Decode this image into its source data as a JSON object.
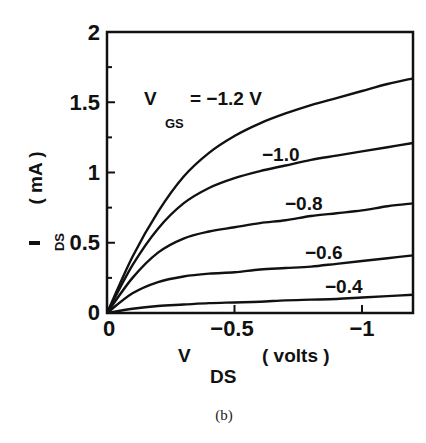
{
  "chart_data": {
    "type": "line",
    "title": "",
    "caption": "(b)",
    "xlabel": "V_DS ( volts )",
    "xlabel_main": "V",
    "xlabel_sub": "DS",
    "xlabel_unit": "( volts )",
    "ylabel": "I_DS ( mA )",
    "ylabel_main": "I",
    "ylabel_sub": "DS",
    "ylabel_unit": "( mA )",
    "xlim": [
      0,
      -1.2
    ],
    "ylim": [
      0,
      2
    ],
    "x_ticks": [
      0,
      -0.5,
      -1
    ],
    "x_tick_labels": [
      "0",
      "−0.5",
      "−1"
    ],
    "y_ticks": [
      0,
      0.5,
      1,
      1.5,
      2
    ],
    "y_tick_labels": [
      "0",
      "0.5",
      "1",
      "1.5",
      "2"
    ],
    "grid": false,
    "legend": "inline labels",
    "param_label_main": "V",
    "param_label_sub": "GS",
    "param_label_prefix": "= −1.2 V",
    "x": [
      0,
      -0.1,
      -0.2,
      -0.3,
      -0.4,
      -0.5,
      -0.6,
      -0.7,
      -0.8,
      -0.9,
      -1.0,
      -1.1,
      -1.2
    ],
    "series": [
      {
        "name": "VGS = -1.2 V",
        "label": "−1.2 V",
        "values": [
          0,
          0.4,
          0.72,
          0.97,
          1.14,
          1.26,
          1.35,
          1.42,
          1.48,
          1.53,
          1.58,
          1.63,
          1.67
        ]
      },
      {
        "name": "VGS = -1.0 V",
        "label": "−1.0",
        "values": [
          0,
          0.34,
          0.6,
          0.78,
          0.89,
          0.96,
          1.01,
          1.05,
          1.09,
          1.12,
          1.15,
          1.18,
          1.21
        ]
      },
      {
        "name": "VGS = -0.8 V",
        "label": "−0.8",
        "values": [
          0,
          0.25,
          0.43,
          0.53,
          0.58,
          0.61,
          0.64,
          0.66,
          0.69,
          0.71,
          0.73,
          0.76,
          0.78
        ]
      },
      {
        "name": "VGS = -0.6 V",
        "label": "−0.6",
        "values": [
          0,
          0.14,
          0.22,
          0.26,
          0.28,
          0.29,
          0.31,
          0.32,
          0.33,
          0.35,
          0.37,
          0.39,
          0.41
        ]
      },
      {
        "name": "VGS = -0.4 V",
        "label": "−0.4",
        "values": [
          0,
          0.03,
          0.05,
          0.06,
          0.07,
          0.075,
          0.08,
          0.09,
          0.095,
          0.1,
          0.11,
          0.12,
          0.13
        ]
      }
    ]
  }
}
